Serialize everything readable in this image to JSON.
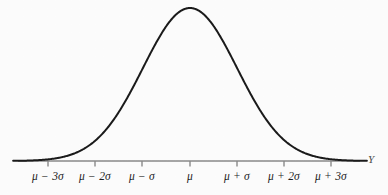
{
  "figure": {
    "kind": "normal-distribution-curve",
    "background_color": "#fdfdfd",
    "curve_color": "#1a1a1a",
    "axis_color": "#8a8a8a",
    "tick_color": "#8a8a8a",
    "label_color": "#1c1c1c"
  },
  "axis": {
    "y_axis_name": "Y",
    "baseline_y_px": 161,
    "x_start_px": 18,
    "x_end_px": 360
  },
  "chart_data": {
    "type": "line",
    "title": "",
    "subtitle": "",
    "xlabel": "Y",
    "ylabel": "",
    "grid": false,
    "legend": false,
    "legend_position": "none",
    "distribution": "normal",
    "mean_label": "μ",
    "sd_label": "σ",
    "categories": [
      "μ − 3σ",
      "μ − 2σ",
      "μ − σ",
      "μ",
      "μ + σ",
      "μ + 2σ",
      "μ + 3σ"
    ],
    "x": [
      -3,
      -2,
      -1,
      0,
      1,
      2,
      3
    ],
    "tick_x_px": [
      48,
      95,
      142,
      190,
      237,
      284,
      331
    ],
    "xlim": [
      -3.6,
      3.6
    ],
    "ylim": [
      0,
      1
    ],
    "values": [
      0.011,
      0.135,
      0.607,
      1.0,
      0.607,
      0.135,
      0.011
    ],
    "series": [
      {
        "name": "normal density",
        "values": [
          0.011,
          0.135,
          0.607,
          1.0,
          0.607,
          0.135,
          0.011
        ]
      }
    ],
    "peak": {
      "x": 0,
      "y": 1.0,
      "x_px": 190,
      "y_px": 8
    },
    "annotations": []
  },
  "ticks": [
    {
      "label": "μ − 3σ",
      "x_px": 48
    },
    {
      "label": "μ − 2σ",
      "x_px": 95
    },
    {
      "label": "μ − σ",
      "x_px": 142
    },
    {
      "label": "μ",
      "x_px": 190
    },
    {
      "label": "μ + σ",
      "x_px": 237
    },
    {
      "label": "μ + 2σ",
      "x_px": 284
    },
    {
      "label": "μ + 3σ",
      "x_px": 331
    }
  ]
}
